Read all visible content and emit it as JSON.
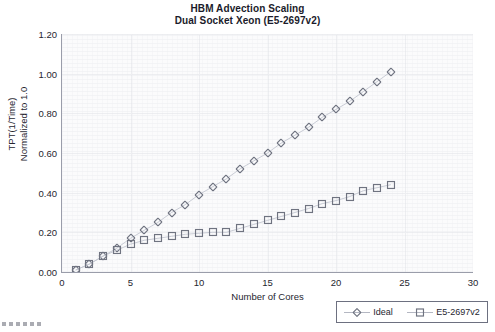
{
  "chart_data": {
    "type": "scatter",
    "title": "HBM Advection Scaling",
    "subtitle": "Dual Socket Xeon (E5-2697v2)",
    "xlabel": "Number of Cores",
    "ylabel_line1": "TPT(1/Time)",
    "ylabel_line2": "Normalized to 1.0",
    "xlim": [
      0,
      30
    ],
    "ylim": [
      0.0,
      1.2
    ],
    "xticks": [
      0,
      5,
      10,
      15,
      20,
      25,
      30
    ],
    "xtick_labels": [
      "0",
      "5",
      "10",
      "15",
      "20",
      "25",
      "30"
    ],
    "yticks": [
      0.0,
      0.2,
      0.4,
      0.6,
      0.8,
      1.0,
      1.2
    ],
    "ytick_labels": [
      "0.00",
      "0.20",
      "0.40",
      "0.60",
      "0.80",
      "1.00",
      "1.20"
    ],
    "grid": true,
    "legend_position": "bottom-right",
    "x": [
      1,
      2,
      3,
      4,
      5,
      6,
      7,
      8,
      9,
      10,
      11,
      12,
      13,
      14,
      15,
      16,
      17,
      18,
      19,
      20,
      21,
      22,
      23,
      24
    ],
    "series": [
      {
        "name": "Ideal",
        "marker": "diamond",
        "color": "#6f7380",
        "line_color": "#c3c6d0",
        "values": [
          0.01,
          0.04,
          0.08,
          0.12,
          0.17,
          0.21,
          0.25,
          0.3,
          0.34,
          0.39,
          0.43,
          0.47,
          0.52,
          0.56,
          0.6,
          0.65,
          0.69,
          0.73,
          0.78,
          0.82,
          0.86,
          0.91,
          0.96,
          1.01
        ]
      },
      {
        "name": "E5-2697v2",
        "marker": "square",
        "color": "#6f7380",
        "line_color": "#c3c6d0",
        "values": [
          0.01,
          0.04,
          0.08,
          0.11,
          0.14,
          0.16,
          0.17,
          0.18,
          0.19,
          0.195,
          0.2,
          0.2,
          0.22,
          0.24,
          0.26,
          0.28,
          0.3,
          0.32,
          0.345,
          0.36,
          0.38,
          0.41,
          0.425,
          0.44
        ]
      }
    ]
  },
  "legend": {
    "entries": [
      {
        "label": "Ideal"
      },
      {
        "label": "E5-2697v2"
      }
    ]
  }
}
